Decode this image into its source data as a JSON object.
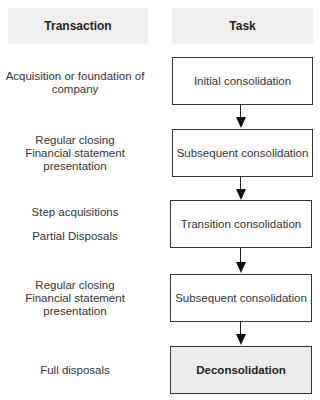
{
  "headers": {
    "transaction": "Transaction",
    "task": "Task"
  },
  "rows": [
    {
      "transaction": [
        "Acquisition or foundation of",
        "company"
      ],
      "task": "Initial consolidation"
    },
    {
      "transaction": [
        "Regular closing",
        "Financial statement",
        "presentation"
      ],
      "task": "Subsequent consolidation"
    },
    {
      "transaction": [
        "Step acquisitions",
        "",
        "Partial Disposals"
      ],
      "task": "Transition consolidation"
    },
    {
      "transaction": [
        "Regular closing",
        "Financial statement",
        "presentation"
      ],
      "task": "Subsequent consolidation"
    },
    {
      "transaction": [
        "Full disposals"
      ],
      "task": "Deconsolidation"
    }
  ],
  "colors": {
    "header_bg": "#efefef",
    "final_box_bg": "#ececec",
    "border": "#333333"
  }
}
